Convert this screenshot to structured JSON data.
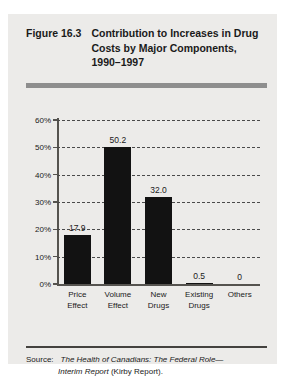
{
  "figure": {
    "number": "Figure 16.3",
    "title": "Contribution to Increases in Drug Costs by Major Components, 1990–1997"
  },
  "source": {
    "label": "Source:",
    "title_part1": "The Health of Canadians: The Federal Role—",
    "title_part2": "Interim Report",
    "trailing": " (Kirby Report)."
  },
  "colors": {
    "panel_background": "#ecebe9",
    "bar_fill": "#121212",
    "header_rule": "#8e8e8e",
    "axis": "#55534f",
    "text": "#1a1a1a"
  },
  "chart_data": {
    "type": "bar",
    "title": "Contribution to Increases in Drug Costs by Major Components, 1990–1997",
    "xlabel": "",
    "ylabel": "",
    "categories": [
      "Price Effect",
      "Volume Effect",
      "New Drugs",
      "Existing Drugs",
      "Others"
    ],
    "values": [
      17.9,
      50.2,
      32.0,
      0.5,
      0
    ],
    "data_labels": [
      "17.9",
      "50.2",
      "32.0",
      "0.5",
      "0"
    ],
    "ylim": [
      0,
      60
    ],
    "yticks": [
      0,
      10,
      20,
      30,
      40,
      50,
      60
    ],
    "ytick_labels": [
      "0%",
      "10%",
      "20%",
      "30%",
      "40%",
      "50%",
      "60%"
    ],
    "grid": true,
    "grid_style": "dashed",
    "legend": false,
    "units": "percent"
  }
}
